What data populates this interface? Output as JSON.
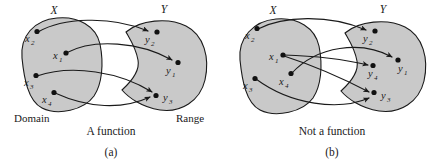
{
  "figure": {
    "background_color": "#ffffff",
    "blob_fill_color": "#c9c9c9",
    "stroke_color": "#1a1a1a"
  },
  "panels": [
    {
      "id": "a",
      "title": "A function",
      "index_label": "(a)",
      "domain_set_label": "X",
      "codomain_set_label": "Y",
      "domain_caption": "Domain",
      "range_caption": "Range",
      "domain_elements": [
        {
          "name": "x2",
          "base": "x",
          "sub": "2"
        },
        {
          "name": "x1",
          "base": "x",
          "sub": "1"
        },
        {
          "name": "x3",
          "base": "x",
          "sub": "3"
        },
        {
          "name": "x4",
          "base": "x",
          "sub": "4"
        }
      ],
      "range_elements": [
        {
          "name": "y2",
          "base": "y",
          "sub": "2"
        },
        {
          "name": "y1",
          "base": "y",
          "sub": "1"
        },
        {
          "name": "y3",
          "base": "y",
          "sub": "3"
        }
      ],
      "mappings": [
        {
          "from": "x2",
          "to": "y2"
        },
        {
          "from": "x1",
          "to": "y1"
        },
        {
          "from": "x3",
          "to": "y3"
        },
        {
          "from": "x4",
          "to": "y3"
        }
      ]
    },
    {
      "id": "b",
      "title": "Not a function",
      "index_label": "(b)",
      "domain_set_label": "X",
      "codomain_set_label": "Y",
      "domain_caption": "",
      "range_caption": "",
      "domain_elements": [
        {
          "name": "x2",
          "base": "x",
          "sub": "2"
        },
        {
          "name": "x1",
          "base": "x",
          "sub": "1"
        },
        {
          "name": "x3",
          "base": "x",
          "sub": "3"
        },
        {
          "name": "x4",
          "base": "x",
          "sub": "4"
        }
      ],
      "range_elements": [
        {
          "name": "y2",
          "base": "y",
          "sub": "2"
        },
        {
          "name": "y1",
          "base": "y",
          "sub": "1"
        },
        {
          "name": "y4",
          "base": "y",
          "sub": "4"
        },
        {
          "name": "y3",
          "base": "y",
          "sub": "3"
        }
      ],
      "mappings": [
        {
          "from": "x2",
          "to": "y2"
        },
        {
          "from": "x1",
          "to": "y4"
        },
        {
          "from": "x1",
          "to": "y3"
        },
        {
          "from": "x4",
          "to": "y1"
        },
        {
          "from": "x3",
          "to": "y3"
        }
      ]
    }
  ]
}
